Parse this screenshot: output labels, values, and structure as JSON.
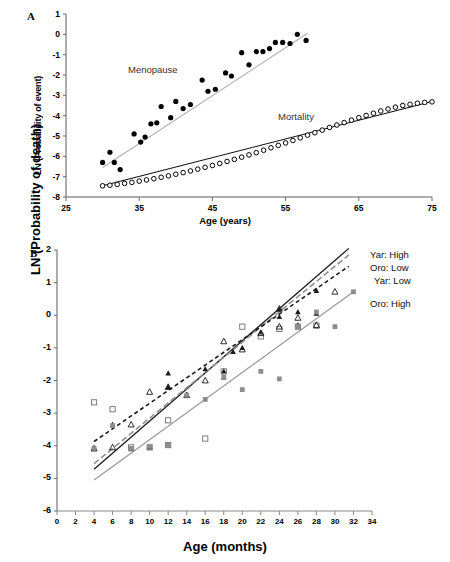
{
  "figure": {
    "panels": [
      {
        "letter": "A",
        "xlabel": "Age (years)",
        "ylabel": "LN (Probability of event)",
        "xticks": [
          "25",
          "35",
          "45",
          "55",
          "65",
          "75"
        ],
        "yticks": [
          "1",
          "0",
          "-1",
          "-2",
          "-3",
          "-4",
          "-5",
          "-6",
          "-7",
          "-8"
        ],
        "annotations": [
          {
            "text": "Menopause"
          },
          {
            "text": "Mortality"
          }
        ]
      },
      {
        "letter": "B",
        "xlabel": "Age (months)",
        "ylabel": "LN (Probability of death)",
        "xticks": [
          "0",
          "2",
          "4",
          "6",
          "8",
          "10",
          "12",
          "14",
          "16",
          "18",
          "20",
          "22",
          "24",
          "26",
          "28",
          "30",
          "32",
          "34"
        ],
        "yticks": [
          "2",
          "1",
          "0",
          "-1",
          "-2",
          "-3",
          "-4",
          "-5",
          "-6"
        ],
        "legend": [
          {
            "label": "Yar: High",
            "style": "solid",
            "color": "#1a1a1a"
          },
          {
            "label": "Oro: Low",
            "style": "dashed",
            "color": "#888888"
          },
          {
            "label": "Yar: Low",
            "style": "dotted",
            "color": "#1a1a1a"
          },
          {
            "label": "Oro: High",
            "style": "solid",
            "color": "#8d8d8d"
          }
        ]
      }
    ]
  },
  "chart_data": [
    {
      "type": "scatter",
      "panel": "A",
      "title": "",
      "xlabel": "Age (years)",
      "ylabel": "LN (Probability of event)",
      "xlim": [
        25,
        75
      ],
      "ylim": [
        -8,
        1
      ],
      "xticks": [
        25,
        35,
        45,
        55,
        65,
        75
      ],
      "yticks": [
        1,
        0,
        -1,
        -2,
        -3,
        -4,
        -5,
        -6,
        -7,
        -8
      ],
      "grid": false,
      "legend_position": "inline-annotation",
      "series": [
        {
          "name": "Menopause",
          "marker": "filled-circle",
          "color": "#000000",
          "trendline": {
            "style": "solid",
            "color": "#b0b0b0",
            "x": [
              30,
              58
            ],
            "y": [
              -6.55,
              0.05
            ]
          },
          "points": [
            [
              30.0,
              -6.3
            ],
            [
              31.0,
              -5.8
            ],
            [
              31.6,
              -6.3
            ],
            [
              32.4,
              -6.65
            ],
            [
              34.3,
              -4.9
            ],
            [
              35.2,
              -5.3
            ],
            [
              35.8,
              -5.05
            ],
            [
              36.6,
              -4.4
            ],
            [
              37.4,
              -4.35
            ],
            [
              38.0,
              -3.55
            ],
            [
              39.3,
              -4.1
            ],
            [
              40.0,
              -3.3
            ],
            [
              41.0,
              -3.65
            ],
            [
              42.0,
              -3.45
            ],
            [
              43.6,
              -2.25
            ],
            [
              44.4,
              -2.8
            ],
            [
              45.4,
              -2.7
            ],
            [
              46.8,
              -1.9
            ],
            [
              47.6,
              -2.05
            ],
            [
              49.0,
              -0.9
            ],
            [
              50.0,
              -1.5
            ],
            [
              51.0,
              -0.85
            ],
            [
              51.9,
              -0.85
            ],
            [
              52.8,
              -0.7
            ],
            [
              53.6,
              -0.4
            ],
            [
              54.6,
              -0.4
            ],
            [
              55.6,
              -0.45
            ],
            [
              56.6,
              0.0
            ],
            [
              57.8,
              -0.3
            ]
          ]
        },
        {
          "name": "Mortality",
          "marker": "open-circle",
          "color": "#000000",
          "trendline": {
            "style": "solid",
            "color": "#111111",
            "x": [
              30,
              75
            ],
            "y": [
              -7.45,
              -3.3
            ]
          },
          "points": [
            [
              30,
              -7.45
            ],
            [
              31,
              -7.42
            ],
            [
              32,
              -7.38
            ],
            [
              33,
              -7.33
            ],
            [
              34,
              -7.28
            ],
            [
              35,
              -7.22
            ],
            [
              36,
              -7.16
            ],
            [
              37,
              -7.1
            ],
            [
              38,
              -7.03
            ],
            [
              39,
              -6.96
            ],
            [
              40,
              -6.88
            ],
            [
              41,
              -6.8
            ],
            [
              42,
              -6.72
            ],
            [
              43,
              -6.63
            ],
            [
              44,
              -6.54
            ],
            [
              45,
              -6.45
            ],
            [
              46,
              -6.35
            ],
            [
              47,
              -6.25
            ],
            [
              48,
              -6.15
            ],
            [
              49,
              -6.04
            ],
            [
              50,
              -5.93
            ],
            [
              51,
              -5.82
            ],
            [
              52,
              -5.7
            ],
            [
              53,
              -5.58
            ],
            [
              54,
              -5.46
            ],
            [
              55,
              -5.34
            ],
            [
              56,
              -5.22
            ],
            [
              57,
              -5.09
            ],
            [
              58,
              -4.96
            ],
            [
              59,
              -4.84
            ],
            [
              60,
              -4.71
            ],
            [
              61,
              -4.58
            ],
            [
              62,
              -4.46
            ],
            [
              63,
              -4.34
            ],
            [
              64,
              -4.22
            ],
            [
              65,
              -4.1
            ],
            [
              66,
              -3.99
            ],
            [
              67,
              -3.88
            ],
            [
              68,
              -3.77
            ],
            [
              69,
              -3.67
            ],
            [
              70,
              -3.58
            ],
            [
              71,
              -3.5
            ],
            [
              72,
              -3.44
            ],
            [
              73,
              -3.39
            ],
            [
              74,
              -3.35
            ],
            [
              75,
              -3.32
            ]
          ]
        }
      ]
    },
    {
      "type": "scatter",
      "panel": "B",
      "title": "",
      "xlabel": "Age (months)",
      "ylabel": "LN (Probability of death)",
      "xlim": [
        0,
        34
      ],
      "ylim": [
        -6,
        2
      ],
      "xticks": [
        0,
        2,
        4,
        6,
        8,
        10,
        12,
        14,
        16,
        18,
        20,
        22,
        24,
        26,
        28,
        30,
        32,
        34
      ],
      "yticks": [
        2,
        1,
        0,
        -1,
        -2,
        -3,
        -4,
        -5,
        -6
      ],
      "grid": false,
      "legend_position": "right",
      "series": [
        {
          "name": "Yar: High",
          "marker": "filled-triangle",
          "color": "#1a1a1a",
          "line": {
            "style": "solid",
            "color": "#1a1a1a",
            "x": [
              4,
              31.5
            ],
            "y": [
              -4.72,
              2.05
            ]
          },
          "points": [
            [
              4,
              -4.1
            ],
            [
              6,
              -3.35
            ],
            [
              8,
              -4.1
            ],
            [
              10,
              -4.05
            ],
            [
              12,
              -1.78
            ],
            [
              12,
              -2.2
            ],
            [
              14,
              -2.45
            ],
            [
              16,
              -1.65
            ],
            [
              18,
              -1.72
            ],
            [
              18,
              -1.9
            ],
            [
              19,
              -1.12
            ],
            [
              20,
              -1.0
            ],
            [
              22,
              -0.52
            ],
            [
              24,
              0.18
            ],
            [
              24,
              -0.05
            ],
            [
              26,
              0.1
            ],
            [
              26,
              -0.3
            ],
            [
              28,
              0.05
            ],
            [
              28,
              0.75
            ]
          ]
        },
        {
          "name": "Oro: Low",
          "marker": "open-square",
          "color": "#888888",
          "line": {
            "style": "dashed",
            "color": "#8f8f8f",
            "x": [
              4,
              31.5
            ],
            "y": [
              -4.55,
              1.85
            ]
          },
          "points": [
            [
              4,
              -2.67
            ],
            [
              6,
              -2.88
            ],
            [
              8,
              -4.05
            ],
            [
              10,
              -4.05
            ],
            [
              12,
              -3.22
            ],
            [
              12,
              -3.98
            ],
            [
              16,
              -3.78
            ],
            [
              18,
              -1.72
            ],
            [
              20,
              -0.35
            ],
            [
              22,
              -0.65
            ],
            [
              24,
              -0.42
            ],
            [
              26,
              -0.35
            ],
            [
              28,
              -0.32
            ]
          ]
        },
        {
          "name": "Yar: Low",
          "marker": "open-triangle",
          "color": "#1a1a1a",
          "line": {
            "style": "dotted",
            "color": "#1a1a1a",
            "x": [
              4,
              31.5
            ],
            "y": [
              -3.87,
              1.5
            ]
          },
          "points": [
            [
              4,
              -4.08
            ],
            [
              6,
              -4.05
            ],
            [
              8,
              -3.35
            ],
            [
              10,
              -2.35
            ],
            [
              12,
              -2.2
            ],
            [
              14,
              -2.45
            ],
            [
              16,
              -2.0
            ],
            [
              18,
              -0.8
            ],
            [
              20,
              -1.05
            ],
            [
              22,
              -0.55
            ],
            [
              24,
              0.2
            ],
            [
              24,
              -0.35
            ],
            [
              26,
              -0.08
            ],
            [
              28,
              -0.3
            ],
            [
              30,
              0.72
            ]
          ]
        },
        {
          "name": "Oro: High",
          "marker": "filled-square-gray",
          "color": "#8d8d8d",
          "line": {
            "style": "solid",
            "color": "#9a9a9a",
            "x": [
              4,
              32
            ],
            "y": [
              -5.05,
              0.72
            ]
          },
          "points": [
            [
              4,
              -4.08
            ],
            [
              6,
              -3.38
            ],
            [
              8,
              -4.08
            ],
            [
              10,
              -4.02
            ],
            [
              12,
              -3.98
            ],
            [
              14,
              -2.45
            ],
            [
              16,
              -2.58
            ],
            [
              18,
              -1.9
            ],
            [
              20,
              -2.28
            ],
            [
              22,
              -1.72
            ],
            [
              24,
              -1.95
            ],
            [
              26,
              -0.35
            ],
            [
              28,
              0.1
            ],
            [
              30,
              -0.35
            ],
            [
              32,
              0.72
            ]
          ]
        }
      ]
    }
  ]
}
